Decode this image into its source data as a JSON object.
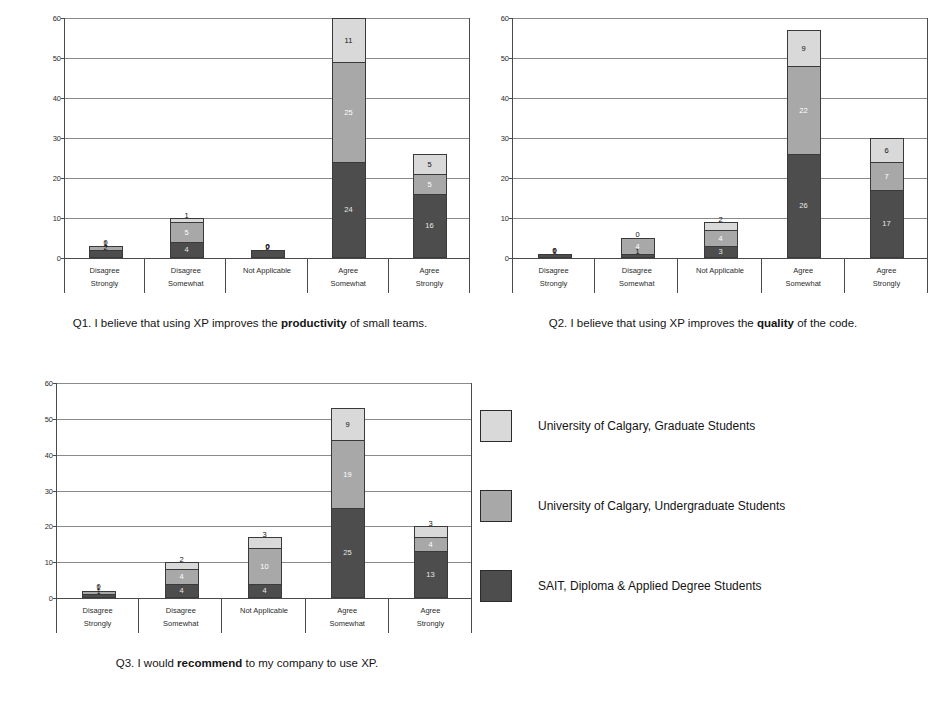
{
  "axis": {
    "yticks": [
      0,
      10,
      20,
      30,
      40,
      50,
      60
    ],
    "ymax": 60,
    "categories": [
      "Disagree Strongly",
      "Disagree Somewhat",
      "Not Applicable",
      "Agree Somewhat",
      "Agree Strongly"
    ],
    "category_lines": [
      [
        "Disagree",
        "Strongly"
      ],
      [
        "Disagree",
        "Somewhat"
      ],
      [
        "Not Applicable",
        ""
      ],
      [
        "Agree",
        "Somewhat"
      ],
      [
        "Agree",
        "Strongly"
      ]
    ]
  },
  "colors": {
    "graduate": "#d9d9d9",
    "undergraduate": "#a8a8a8",
    "sait": "#4d4d4d",
    "axis": "#4a4a4a",
    "grid": "#8a8a8a"
  },
  "legend": {
    "position": "right-bottom",
    "items": [
      {
        "label": "University of Calgary, Graduate Students",
        "color": "#d9d9d9",
        "swatch_name": "swatch-graduate"
      },
      {
        "label": "University of Calgary, Undergraduate Students",
        "color": "#a8a8a8",
        "swatch_name": "swatch-undergraduate"
      },
      {
        "label": "SAIT, Diploma & Applied Degree Students",
        "color": "#4d4d4d",
        "swatch_name": "swatch-sait"
      }
    ]
  },
  "captions": {
    "q1_prefix": "Q1. I believe that using XP improves the ",
    "q1_bold": "productivity",
    "q1_suffix": " of small teams.",
    "q2_prefix": "Q2. I believe that using XP improves the ",
    "q2_bold": "quality",
    "q2_suffix": " of the code.",
    "q3_prefix": "Q3. I would ",
    "q3_bold": "recommend",
    "q3_suffix": " to my company to use XP."
  },
  "chart_data": [
    {
      "id": "q1",
      "type": "bar",
      "stacked": true,
      "title": "Q1. I believe that using XP improves the productivity of small teams.",
      "xlabel": "",
      "ylabel": "",
      "ylim": [
        0,
        60
      ],
      "grid": true,
      "categories": [
        "Disagree Strongly",
        "Disagree Somewhat",
        "Not Applicable",
        "Agree Somewhat",
        "Agree Strongly"
      ],
      "series": [
        {
          "name": "SAIT, Diploma & Applied Degree Students",
          "color": "#4d4d4d",
          "values": [
            2,
            4,
            2,
            24,
            16
          ]
        },
        {
          "name": "University of Calgary, Undergraduate Students",
          "color": "#a8a8a8",
          "values": [
            1,
            5,
            0,
            25,
            5
          ]
        },
        {
          "name": "University of Calgary, Graduate Students",
          "color": "#d9d9d9",
          "values": [
            0,
            1,
            0,
            11,
            5
          ]
        }
      ],
      "totals": [
        3,
        10,
        2,
        60,
        26
      ]
    },
    {
      "id": "q2",
      "type": "bar",
      "stacked": true,
      "title": "Q2. I believe that using XP improves the quality of the code.",
      "xlabel": "",
      "ylabel": "",
      "ylim": [
        0,
        60
      ],
      "grid": true,
      "categories": [
        "Disagree Strongly",
        "Disagree Somewhat",
        "Not Applicable",
        "Agree Somewhat",
        "Agree Strongly"
      ],
      "series": [
        {
          "name": "SAIT, Diploma & Applied Degree Students",
          "color": "#4d4d4d",
          "values": [
            1,
            1,
            3,
            26,
            17
          ]
        },
        {
          "name": "University of Calgary, Undergraduate Students",
          "color": "#a8a8a8",
          "values": [
            0,
            4,
            4,
            22,
            7
          ]
        },
        {
          "name": "University of Calgary, Graduate Students",
          "color": "#d9d9d9",
          "values": [
            0,
            0,
            2,
            9,
            6
          ]
        }
      ],
      "totals": [
        1,
        5,
        9,
        57,
        30
      ]
    },
    {
      "id": "q3",
      "type": "bar",
      "stacked": true,
      "title": "Q3. I would recommend to my company to use XP.",
      "xlabel": "",
      "ylabel": "",
      "ylim": [
        0,
        60
      ],
      "grid": true,
      "categories": [
        "Disagree Strongly",
        "Disagree Somewhat",
        "Not Applicable",
        "Agree Somewhat",
        "Agree Strongly"
      ],
      "series": [
        {
          "name": "SAIT, Diploma & Applied Degree Students",
          "color": "#4d4d4d",
          "values": [
            1,
            4,
            4,
            25,
            13
          ]
        },
        {
          "name": "University of Calgary, Undergraduate Students",
          "color": "#a8a8a8",
          "values": [
            1,
            4,
            10,
            19,
            4
          ]
        },
        {
          "name": "University of Calgary, Graduate Students",
          "color": "#d9d9d9",
          "values": [
            0,
            2,
            3,
            9,
            3
          ]
        }
      ],
      "totals": [
        2,
        10,
        17,
        53,
        20
      ]
    }
  ]
}
